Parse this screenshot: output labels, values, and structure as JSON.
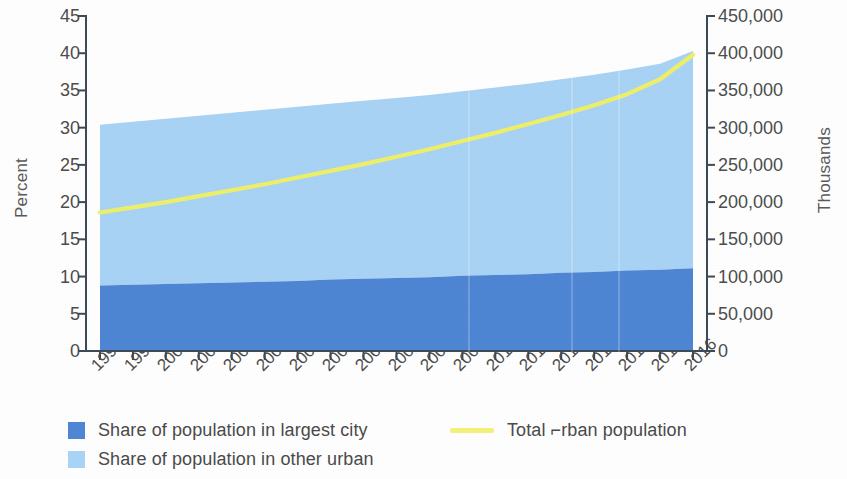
{
  "axes": {
    "left_title": "Percent",
    "right_title": "Thousands",
    "left_ticks": [
      "45",
      "40",
      "35",
      "30",
      "25",
      "20",
      "15",
      "10",
      "5",
      "0"
    ],
    "right_ticks": [
      "450,000",
      "400,000",
      "350,000",
      "300,000",
      "250,000",
      "200,000",
      "150,000",
      "100,000",
      "50,000",
      "0"
    ]
  },
  "legend": {
    "items": [
      {
        "label": "Share of population in largest city",
        "marker": "square",
        "color": "#4f86d4"
      },
      {
        "label": "Share of population in other urban",
        "marker": "square",
        "color": "#a9d3f5"
      },
      {
        "label": "Total ⌐rban population",
        "marker": "line",
        "color": "#f2f07a"
      }
    ]
  },
  "colors": {
    "largest_city": "#4f86d4",
    "other_urban": "#a9d3f5",
    "total_urban_line": "#eef06a",
    "axis": "#3c4a5a",
    "text": "#4a4a4a"
  },
  "chart_data": {
    "type": "area",
    "title": "",
    "xlabel": "",
    "ylabel": "Percent",
    "y2label": "Thousands",
    "stacked": true,
    "grid": false,
    "legend_position": "bottom",
    "ylim": [
      0,
      45
    ],
    "y2lim": [
      0,
      450000
    ],
    "ytick_step": 5,
    "y2tick_step": 50000,
    "categories": [
      "1998",
      "1999",
      "2000",
      "2001",
      "2002",
      "2003",
      "2004",
      "2005",
      "2006",
      "2007",
      "2008",
      "2009",
      "2010",
      "2011",
      "2012",
      "2013",
      "2014",
      "2015",
      "2016"
    ],
    "series": [
      {
        "name": "Share of population in largest city",
        "axis": "left",
        "units": "percent",
        "type": "area",
        "color": "#4f86d4",
        "values": [
          8.8,
          8.9,
          9.0,
          9.1,
          9.2,
          9.3,
          9.4,
          9.6,
          9.7,
          9.8,
          9.9,
          10.1,
          10.2,
          10.3,
          10.5,
          10.6,
          10.8,
          10.9,
          11.1
        ]
      },
      {
        "name": "Share of population in other urban",
        "axis": "left",
        "units": "percent",
        "type": "area",
        "color": "#a9d3f5",
        "values": [
          21.6,
          21.9,
          22.2,
          22.5,
          22.8,
          23.1,
          23.4,
          23.6,
          23.9,
          24.2,
          24.5,
          24.8,
          25.2,
          25.6,
          26.0,
          26.5,
          27.0,
          27.7,
          29.2
        ],
        "cumulative_top": [
          30.4,
          30.8,
          31.2,
          31.6,
          32.0,
          32.4,
          32.8,
          33.2,
          33.6,
          34.0,
          34.4,
          34.9,
          35.4,
          35.9,
          36.5,
          37.1,
          37.8,
          38.6,
          40.3
        ]
      },
      {
        "name": "Total ⌐rban population",
        "axis": "right",
        "units": "thousands",
        "type": "line",
        "color": "#eef06a",
        "values": [
          186000,
          193000,
          200000,
          208000,
          216000,
          224000,
          233000,
          242000,
          251000,
          261000,
          271000,
          282000,
          293000,
          305000,
          317000,
          330000,
          345000,
          365000,
          398000
        ]
      }
    ]
  }
}
